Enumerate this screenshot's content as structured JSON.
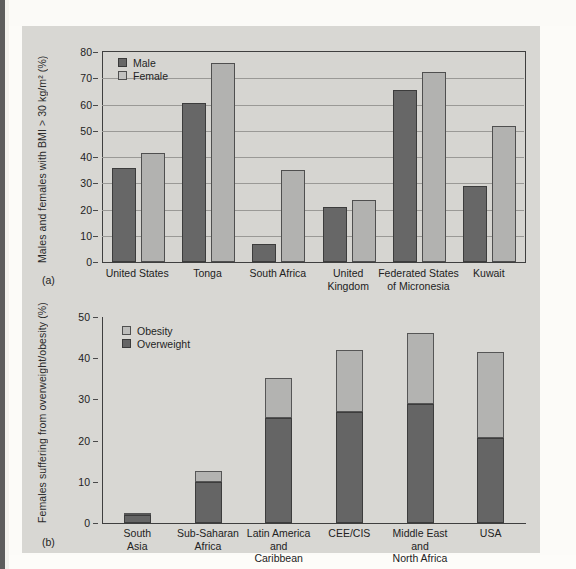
{
  "figure": {
    "background": "#d8d7d3",
    "panel_a_tag": "(a)",
    "panel_b_tag": "(b)"
  },
  "chart_data": [
    {
      "type": "bar",
      "panel": "(a)",
      "title": "",
      "xlabel": "",
      "ylabel": "Males and females with BMI > 30 kg/m² (%)",
      "ylim": [
        0,
        80
      ],
      "yticks": [
        0,
        10,
        20,
        30,
        40,
        50,
        60,
        70,
        80
      ],
      "grid": true,
      "legend_position": "top-left",
      "categories": [
        "United States",
        "Tonga",
        "South Africa",
        "United\nKingdom",
        "Federated States\nof Micronesia",
        "Kuwait"
      ],
      "series": [
        {
          "name": "Male",
          "color": "#676767",
          "values": [
            36.0,
            60.5,
            7.0,
            21.0,
            65.5,
            29.0
          ]
        },
        {
          "name": "Female",
          "color": "#b2b2b0",
          "values": [
            41.5,
            76.0,
            35.0,
            23.5,
            72.5,
            52.0
          ]
        }
      ]
    },
    {
      "type": "bar",
      "panel": "(b)",
      "stacked": true,
      "title": "",
      "xlabel": "",
      "ylabel": "Females suffering from overweight/obesity (%)",
      "ylim": [
        0,
        50
      ],
      "yticks": [
        0,
        10,
        20,
        30,
        40,
        50
      ],
      "grid": false,
      "legend_position": "top-left",
      "categories": [
        "South\nAsia",
        "Sub-Saharan\nAfrica",
        "Latin America\nand\nCaribbean",
        "CEE/CIS",
        "Middle East\nand\nNorth Africa",
        "USA"
      ],
      "series": [
        {
          "name": "Overweight",
          "color": "#656565",
          "values": [
            2.0,
            10.0,
            25.5,
            27.0,
            29.0,
            20.7
          ]
        },
        {
          "name": "Obesity",
          "color": "#b3b3b1",
          "values": [
            0.5,
            2.7,
            9.8,
            15.0,
            17.0,
            20.8
          ]
        }
      ],
      "totals": [
        2.5,
        12.7,
        35.3,
        42.0,
        46.0,
        41.5
      ]
    }
  ]
}
